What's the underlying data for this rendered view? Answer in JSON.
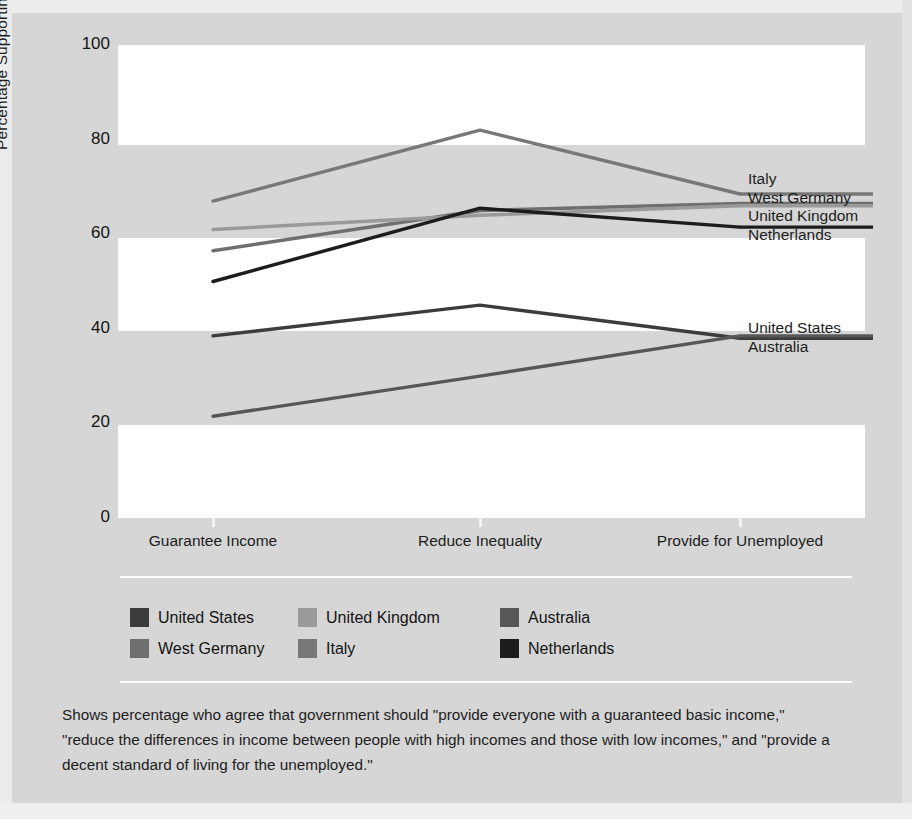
{
  "chart_data": {
    "type": "line",
    "title": "",
    "xlabel": "",
    "ylabel": "Percentage Supporting Government Involvement",
    "categories": [
      "Guarantee Income",
      "Reduce Inequality",
      "Provide for Unemployed"
    ],
    "ylim": [
      0,
      100
    ],
    "yticks": [
      0,
      20,
      40,
      60,
      80,
      100
    ],
    "grid": "horizontal-banded",
    "legend_position": "below-plot",
    "series": [
      {
        "name": "United States",
        "values": [
          38.5,
          45.0,
          38.0
        ],
        "color": "#3c3c3c"
      },
      {
        "name": "West Germany",
        "values": [
          56.5,
          65.0,
          66.5
        ],
        "color": "#6f6f6f"
      },
      {
        "name": "United Kingdom",
        "values": [
          61.0,
          64.0,
          66.0
        ],
        "color": "#9a9a9a"
      },
      {
        "name": "Italy",
        "values": [
          67.0,
          82.0,
          68.5
        ],
        "color": "#787878"
      },
      {
        "name": "Australia",
        "values": [
          21.5,
          30.0,
          38.5
        ],
        "color": "#575757"
      },
      {
        "name": "Netherlands",
        "values": [
          50.0,
          65.5,
          61.5
        ],
        "color": "#1c1c1c"
      }
    ],
    "annotations": [
      {
        "text": "Italy",
        "at_value": 68.5
      },
      {
        "text": "West Germany",
        "at_value": 66.5
      },
      {
        "text": "United Kingdom",
        "at_value": 66.0
      },
      {
        "text": "Netherlands",
        "at_value": 61.5
      },
      {
        "text": "United States",
        "at_value": 38.0
      },
      {
        "text": "Australia",
        "at_value": 38.5
      }
    ]
  },
  "axes": {
    "y_title": "Percentage Supporting Government Involvement",
    "y_tick_labels": [
      "100",
      "80",
      "60",
      "40",
      "20",
      "0"
    ],
    "x_tick_labels": [
      "Guarantee Income",
      "Reduce Inequality",
      "Provide for Unemployed"
    ]
  },
  "inline_labels": {
    "upper": [
      "Italy",
      "West Germany",
      "United Kingdom",
      "Netherlands"
    ],
    "lower": [
      "United States",
      "Australia"
    ]
  },
  "legend": {
    "entries": [
      {
        "label": "United States",
        "color": "#3c3c3c"
      },
      {
        "label": "United Kingdom",
        "color": "#9a9a9a"
      },
      {
        "label": "Australia",
        "color": "#575757"
      },
      {
        "label": "West Germany",
        "color": "#6f6f6f"
      },
      {
        "label": "Italy",
        "color": "#787878"
      },
      {
        "label": "Netherlands",
        "color": "#1c1c1c"
      }
    ]
  },
  "caption": {
    "text": "Shows percentage who agree that government should \"provide everyone with a guaranteed basic income,\" \"reduce the differences in income between people with high incomes and those with low incomes,\" and \"provide a decent standard of living for the unemployed.\""
  },
  "colors": {
    "page_background": "#d6d6d6",
    "plot_band": "#ffffff",
    "text": "#1d1d1d",
    "separator": "#fbfbfb"
  }
}
